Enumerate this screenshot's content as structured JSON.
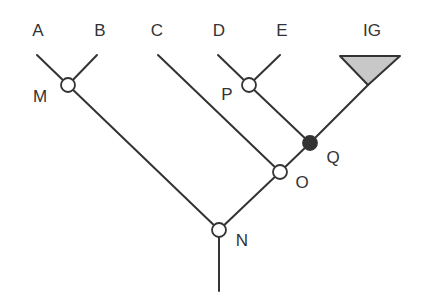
{
  "diagram": {
    "type": "phylogenetic-tree",
    "taxa": [
      {
        "label": "A",
        "x": 38,
        "y": 30
      },
      {
        "label": "B",
        "x": 100,
        "y": 30
      },
      {
        "label": "C",
        "x": 157,
        "y": 30
      },
      {
        "label": "D",
        "x": 219,
        "y": 30
      },
      {
        "label": "E",
        "x": 282,
        "y": 30
      },
      {
        "label": "IG",
        "x": 372,
        "y": 30
      }
    ],
    "nodes": [
      {
        "label": "M",
        "x": 68,
        "y": 85,
        "filled": false,
        "label_x": 40,
        "label_y": 96
      },
      {
        "label": "P",
        "x": 249,
        "y": 85,
        "filled": false,
        "label_x": 227,
        "label_y": 94
      },
      {
        "label": "Q",
        "x": 310,
        "y": 143,
        "filled": true,
        "label_x": 333,
        "label_y": 157
      },
      {
        "label": "O",
        "x": 280,
        "y": 172,
        "filled": false,
        "label_x": 302,
        "label_y": 182
      },
      {
        "label": "N",
        "x": 219,
        "y": 230,
        "filled": false,
        "label_x": 242,
        "label_y": 240
      }
    ],
    "colors": {
      "line": "#333333",
      "node_fill": "#ffffff",
      "node_filled": "#333333",
      "triangle_fill": "#c8c8c8"
    }
  }
}
